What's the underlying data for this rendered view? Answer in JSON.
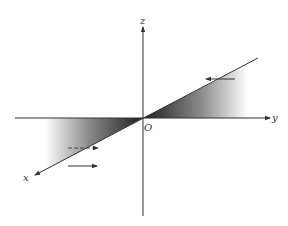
{
  "figure": {
    "type": "coordinate-system-3d",
    "axes": {
      "x_label": "x",
      "y_label": "y",
      "z_label": "z",
      "origin_label": "O"
    },
    "shaded_regions": [
      {
        "name": "positive-y-half-plane-wedge",
        "description": "gradient wedge between y axis and x-direction line on +y side"
      },
      {
        "name": "negative-y-half-plane-wedge",
        "description": "gradient wedge between y axis and x-direction line on -y side"
      }
    ],
    "arrows": [
      {
        "name": "upper-right-arrow",
        "direction": "left",
        "style": "solid"
      },
      {
        "name": "lower-left-dashed-arrow",
        "direction": "right",
        "style": "dashed"
      },
      {
        "name": "lower-left-solid-arrow",
        "direction": "right",
        "style": "solid"
      }
    ],
    "colors": {
      "line": "#333333",
      "shade_dark": "#2a2a2a",
      "shade_light": "#ffffff"
    }
  }
}
